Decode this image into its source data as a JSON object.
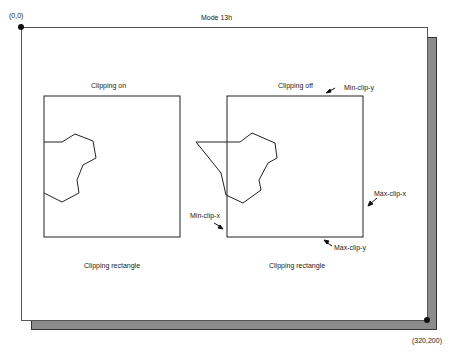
{
  "diagram": {
    "title": "Mode 13h",
    "origin_label": "(0,0)",
    "corner_label": "(320,200)",
    "panels": [
      {
        "heading": "Clipping on",
        "caption": "Clipping rectangle"
      },
      {
        "heading": "Clipping off",
        "caption": "Clipping rectangle",
        "annotations": {
          "min_clip_y": "Min-clip-y",
          "max_clip_x": "Max-clip-x",
          "min_clip_x": "Min-clip-x",
          "max_clip_y": "Max-clip-y"
        }
      }
    ],
    "colors": {
      "frame": "#555555",
      "shadow": "#8c8c8c",
      "stroke": "#222222",
      "background": "#ffffff"
    }
  }
}
